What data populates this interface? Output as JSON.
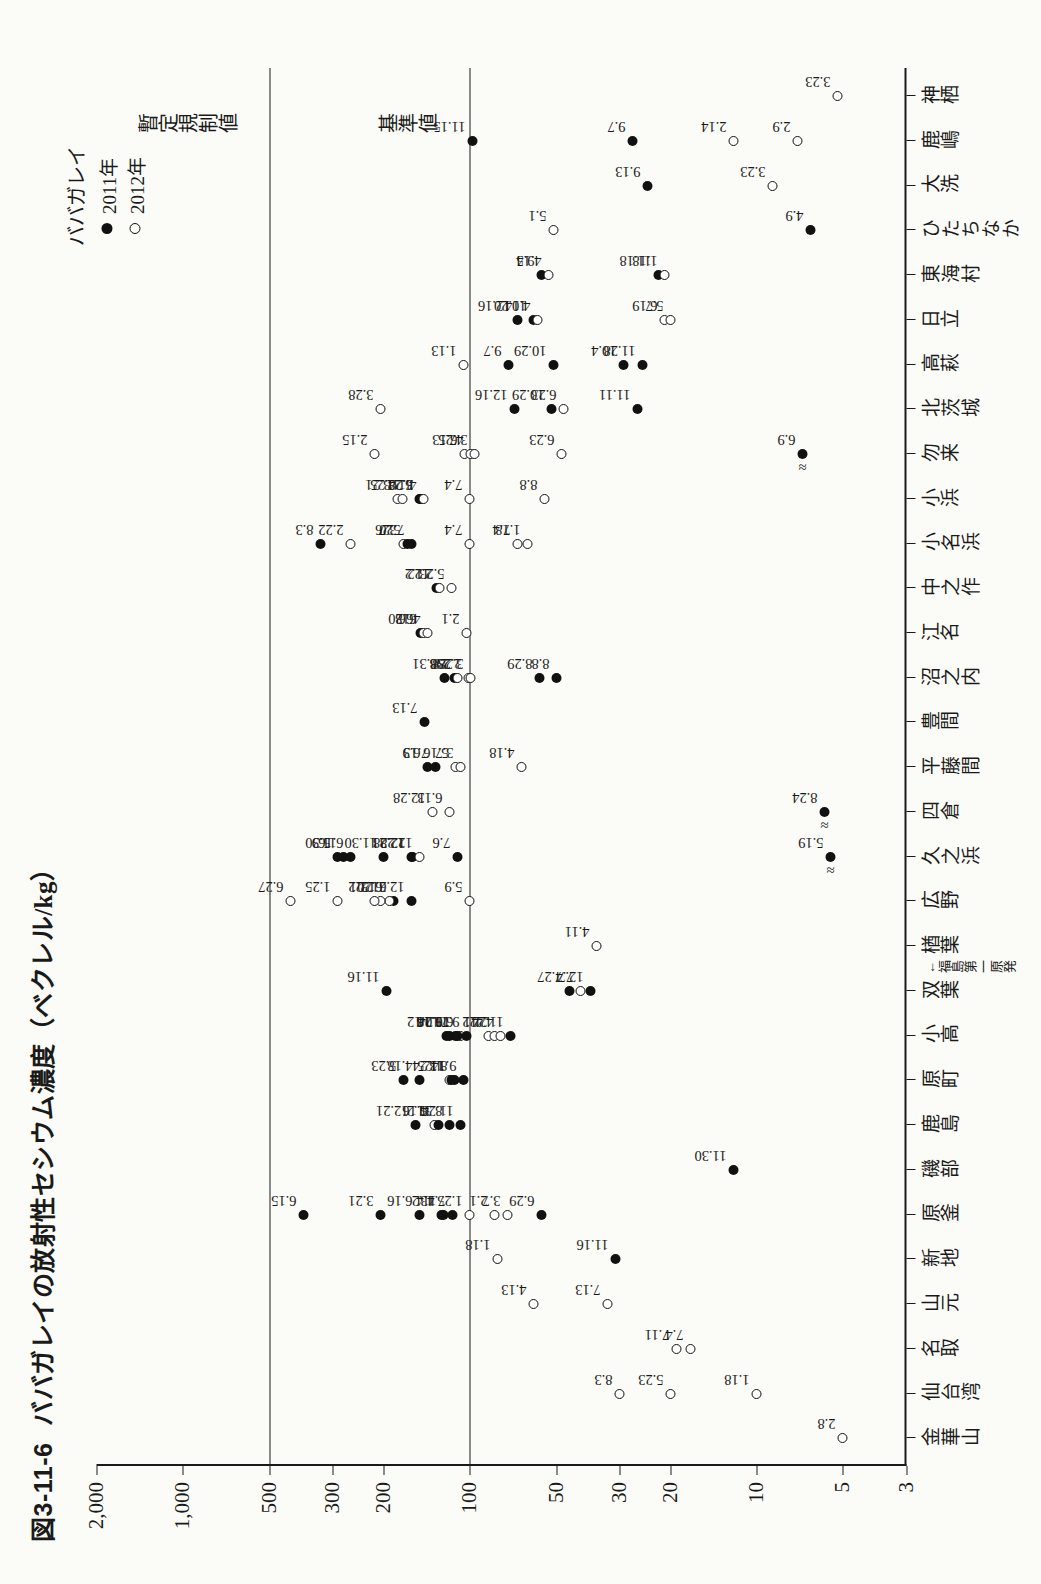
{
  "figure": {
    "number": "図3-11-6",
    "title": "ババガレイの放射性セシウム濃度（ベクレル/kg）"
  },
  "legend": {
    "title": "ババガレイ",
    "items": [
      {
        "label": "2011年",
        "marker": "filled-circle"
      },
      {
        "label": "2012年",
        "marker": "open-circle"
      }
    ]
  },
  "axes": {
    "y_title": "放射性セシウム濃度（ベクレル／kg）",
    "y_ticks": [
      "2,000",
      "1,000",
      "500",
      "300",
      "200",
      "100",
      "50",
      "30",
      "20",
      "10",
      "5",
      "3"
    ],
    "y_scale": "log",
    "y_min": 3,
    "y_max": 2000
  },
  "reference_lines": [
    {
      "label": "暫定規制値",
      "value": 500
    },
    {
      "label": "基準値",
      "value": 100
    }
  ],
  "locations": [
    "金華山",
    "仙台湾",
    "名取",
    "山元",
    "新地",
    "原釜",
    "磯部",
    "鹿島",
    "原町",
    "小高",
    "双葉",
    "楢葉",
    "広野",
    "久之浜",
    "四倉",
    "平藤間",
    "豊間",
    "沼之内",
    "江名",
    "中之作",
    "小名浜",
    "小浜",
    "勿来",
    "北茨城",
    "高萩",
    "日立",
    "東海村",
    "ひたちなか",
    "大洗",
    "鹿嶋",
    "神栖"
  ],
  "npp_marker": {
    "label": "福島第一原発",
    "location": "双葉"
  },
  "chart_data": {
    "type": "scatter",
    "title": "ババガレイの放射性セシウム濃度（ベクレル/kg）",
    "xlabel": "",
    "ylabel": "放射性セシウム濃度（ベクレル／kg）",
    "yscale": "log",
    "ylim": [
      3,
      2000
    ],
    "grid": false,
    "legend_position": "top-right",
    "series": [
      {
        "name": "2011年",
        "marker": "filled-circle"
      },
      {
        "name": "2012年",
        "marker": "open-circle"
      }
    ],
    "points": [
      {
        "loc": "金華山",
        "year": 2012,
        "value": 5,
        "label": "2.8"
      },
      {
        "loc": "仙台湾",
        "year": 2012,
        "value": 20,
        "label": "5.23"
      },
      {
        "loc": "仙台湾",
        "year": 2012,
        "value": 10,
        "label": "1.18"
      },
      {
        "loc": "仙台湾",
        "year": 2012,
        "value": 30,
        "label": "8.3"
      },
      {
        "loc": "名取",
        "year": 2012,
        "value": 17,
        "label": "7.4"
      },
      {
        "loc": "名取",
        "year": 2012,
        "value": 19,
        "label": "7.11"
      },
      {
        "loc": "山元",
        "year": 2012,
        "value": 33,
        "label": "7.13"
      },
      {
        "loc": "山元",
        "year": 2012,
        "value": 60,
        "label": "4.13"
      },
      {
        "loc": "新地",
        "year": 2012,
        "value": 80,
        "label": "1.18"
      },
      {
        "loc": "新地",
        "year": 2011,
        "value": 31,
        "label": "11.16"
      },
      {
        "loc": "原釜",
        "year": 2011,
        "value": 380,
        "label": "6.15"
      },
      {
        "loc": "原釜",
        "year": 2011,
        "value": 205,
        "label": "3.21"
      },
      {
        "loc": "原釜",
        "year": 2011,
        "value": 150,
        "label": "6.16"
      },
      {
        "loc": "原釜",
        "year": 2011,
        "value": 125,
        "label": "4.4"
      },
      {
        "loc": "原釜",
        "year": 2011,
        "value": 123,
        "label": "11.2"
      },
      {
        "loc": "原釜",
        "year": 2011,
        "value": 115,
        "label": "7.13"
      },
      {
        "loc": "原釜",
        "year": 2012,
        "value": 100,
        "label": "1.25"
      },
      {
        "loc": "原釜",
        "year": 2012,
        "value": 82,
        "label": "2.1"
      },
      {
        "loc": "原釜",
        "year": 2012,
        "value": 74,
        "label": "3.7"
      },
      {
        "loc": "原釜",
        "year": 2011,
        "value": 56,
        "label": "6.29"
      },
      {
        "loc": "磯部",
        "year": 2011,
        "value": 12,
        "label": "11.30"
      },
      {
        "loc": "鹿島",
        "year": 2011,
        "value": 155,
        "label": "12.21"
      },
      {
        "loc": "鹿島",
        "year": 2012,
        "value": 133,
        "label": "5.16"
      },
      {
        "loc": "鹿島",
        "year": 2011,
        "value": 128,
        "label": "11.2"
      },
      {
        "loc": "鹿島",
        "year": 2011,
        "value": 118,
        "label": "8.31"
      },
      {
        "loc": "鹿島",
        "year": 2011,
        "value": 108,
        "label": "11.24"
      },
      {
        "loc": "原町",
        "year": 2011,
        "value": 170,
        "label": "5.23"
      },
      {
        "loc": "原町",
        "year": 2011,
        "value": 150,
        "label": "4.18"
      },
      {
        "loc": "原町",
        "year": 2012,
        "value": 118,
        "label": "1.25"
      },
      {
        "loc": "原町",
        "year": 2011,
        "value": 116,
        "label": "11.24"
      },
      {
        "loc": "原町",
        "year": 2011,
        "value": 113,
        "label": "8.3"
      },
      {
        "loc": "原町",
        "year": 2011,
        "value": 105,
        "label": "9.14"
      },
      {
        "loc": "小高",
        "year": 2011,
        "value": 118,
        "label": "9.28"
      },
      {
        "loc": "小高",
        "year": 2011,
        "value": 112,
        "label": "11.16"
      },
      {
        "loc": "小高",
        "year": 2012,
        "value": 108,
        "label": "6.6"
      },
      {
        "loc": "小高",
        "year": 2011,
        "value": 103,
        "label": "9.7"
      },
      {
        "loc": "小高",
        "year": 2011,
        "value": 120,
        "label": "10.12"
      },
      {
        "loc": "小高",
        "year": 2011,
        "value": 110,
        "label": "11.24"
      },
      {
        "loc": "小高",
        "year": 2012,
        "value": 86,
        "label": "2.1"
      },
      {
        "loc": "小高",
        "year": 2012,
        "value": 82,
        "label": "2.22"
      },
      {
        "loc": "小高",
        "year": 2012,
        "value": 78,
        "label": "4.4"
      },
      {
        "loc": "小高",
        "year": 2011,
        "value": 72,
        "label": "11.24"
      },
      {
        "loc": "双葉",
        "year": 2011,
        "value": 195,
        "label": "11.16"
      },
      {
        "loc": "双葉",
        "year": 2011,
        "value": 45,
        "label": "7.27"
      },
      {
        "loc": "双葉",
        "year": 2011,
        "value": 38,
        "label": "12.7"
      },
      {
        "loc": "双葉",
        "year": 2012,
        "value": 41,
        "label": "7.4"
      },
      {
        "loc": "楢葉",
        "year": 2012,
        "value": 36,
        "label": "4.11"
      },
      {
        "loc": "広野",
        "year": 2012,
        "value": 420,
        "label": "6.27"
      },
      {
        "loc": "広野",
        "year": 2011,
        "value": 185,
        "label": "6.13"
      },
      {
        "loc": "広野",
        "year": 2012,
        "value": 190,
        "label": "6.20"
      },
      {
        "loc": "広野",
        "year": 2011,
        "value": 160,
        "label": "12.21"
      },
      {
        "loc": "広野",
        "year": 2012,
        "value": 205,
        "label": "2.22"
      },
      {
        "loc": "広野",
        "year": 2012,
        "value": 215,
        "label": "2.1"
      },
      {
        "loc": "広野",
        "year": 2012,
        "value": 100,
        "label": "5.9"
      },
      {
        "loc": "広野",
        "year": 2012,
        "value": 290,
        "label": "1.25"
      },
      {
        "loc": "久之浜",
        "year": 2011,
        "value": 290,
        "label": "5.30"
      },
      {
        "loc": "久之浜",
        "year": 2011,
        "value": 275,
        "label": "11.9"
      },
      {
        "loc": "久之浜",
        "year": 2011,
        "value": 260,
        "label": "6.16"
      },
      {
        "loc": "久之浜",
        "year": 2011,
        "value": 200,
        "label": "11.30"
      },
      {
        "loc": "久之浜",
        "year": 2011,
        "value": 160,
        "label": "12.21"
      },
      {
        "loc": "久之浜",
        "year": 2011,
        "value": 158,
        "label": "12.28"
      },
      {
        "loc": "久之浜",
        "year": 2012,
        "value": 150,
        "label": "12.28"
      },
      {
        "loc": "久之浜",
        "year": 2011,
        "value": 110,
        "label": "7.6"
      },
      {
        "loc": "久之浜",
        "year": 2011,
        "value": 5.5,
        "label": "5.19",
        "break": true
      },
      {
        "loc": "四倉",
        "year": 2011,
        "value": 5.8,
        "label": "8.24",
        "break": true
      },
      {
        "loc": "四倉",
        "year": 2012,
        "value": 135,
        "label": "12.28"
      },
      {
        "loc": "四倉",
        "year": 2012,
        "value": 118,
        "label": "6.13"
      },
      {
        "loc": "平藤間",
        "year": 2011,
        "value": 140,
        "label": "6.9"
      },
      {
        "loc": "平藤間",
        "year": 2011,
        "value": 132,
        "label": "7.13"
      },
      {
        "loc": "平藤間",
        "year": 2012,
        "value": 112,
        "label": "5.16"
      },
      {
        "loc": "平藤間",
        "year": 2012,
        "value": 108,
        "label": "3.7"
      },
      {
        "loc": "平藤間",
        "year": 2012,
        "value": 66,
        "label": "4.18"
      },
      {
        "loc": "豊間",
        "year": 2011,
        "value": 144,
        "label": "7.13"
      },
      {
        "loc": "沼之内",
        "year": 2011,
        "value": 122,
        "label": "8.31"
      },
      {
        "loc": "沼之内",
        "year": 2011,
        "value": 113,
        "label": "2.8"
      },
      {
        "loc": "沼之内",
        "year": 2012,
        "value": 110,
        "label": "2.8"
      },
      {
        "loc": "沼之内",
        "year": 2012,
        "value": 101,
        "label": "2.29"
      },
      {
        "loc": "沼之内",
        "year": 2012,
        "value": 99,
        "label": "3.28"
      },
      {
        "loc": "沼之内",
        "year": 2011,
        "value": 57,
        "label": "8.29"
      },
      {
        "loc": "沼之内",
        "year": 2011,
        "value": 50,
        "label": "8.8"
      },
      {
        "loc": "江名",
        "year": 2011,
        "value": 148,
        "label": "6.20"
      },
      {
        "loc": "江名",
        "year": 2012,
        "value": 145,
        "label": "6.6"
      },
      {
        "loc": "江名",
        "year": 2012,
        "value": 140,
        "label": "4.18"
      },
      {
        "loc": "江名",
        "year": 2012,
        "value": 103,
        "label": "2.1"
      },
      {
        "loc": "中之作",
        "year": 2011,
        "value": 130,
        "label": "11.2"
      },
      {
        "loc": "中之作",
        "year": 2012,
        "value": 127,
        "label": "2.22"
      },
      {
        "loc": "中之作",
        "year": 2012,
        "value": 116,
        "label": "5.23"
      },
      {
        "loc": "小名浜",
        "year": 2011,
        "value": 330,
        "label": "8.3"
      },
      {
        "loc": "小名浜",
        "year": 2012,
        "value": 260,
        "label": "2.22"
      },
      {
        "loc": "小名浜",
        "year": 2012,
        "value": 170,
        "label": "3.7"
      },
      {
        "loc": "小名浜",
        "year": 2011,
        "value": 165,
        "label": "5.26"
      },
      {
        "loc": "小名浜",
        "year": 2011,
        "value": 160,
        "label": "7.20"
      },
      {
        "loc": "小名浜",
        "year": 2012,
        "value": 100,
        "label": "7.4"
      },
      {
        "loc": "小名浜",
        "year": 2012,
        "value": 68,
        "label": "7.4"
      },
      {
        "loc": "小名浜",
        "year": 2012,
        "value": 63,
        "label": "1.18"
      },
      {
        "loc": "小浜",
        "year": 2012,
        "value": 178,
        "label": "3.21"
      },
      {
        "loc": "小浜",
        "year": 2012,
        "value": 172,
        "label": "4.25"
      },
      {
        "loc": "小浜",
        "year": 2011,
        "value": 150,
        "label": "6.22"
      },
      {
        "loc": "小浜",
        "year": 2011,
        "value": 148,
        "label": "3.28"
      },
      {
        "loc": "小浜",
        "year": 2012,
        "value": 145,
        "label": "4.11"
      },
      {
        "loc": "小浜",
        "year": 2012,
        "value": 100,
        "label": "7.4"
      },
      {
        "loc": "小浜",
        "year": 2012,
        "value": 55,
        "label": "8.8"
      },
      {
        "loc": "勿来",
        "year": 2012,
        "value": 215,
        "label": "2.15"
      },
      {
        "loc": "勿来",
        "year": 2012,
        "value": 104,
        "label": "6.13"
      },
      {
        "loc": "勿来",
        "year": 2012,
        "value": 99,
        "label": "4.25"
      },
      {
        "loc": "勿来",
        "year": 2012,
        "value": 96,
        "label": "3.7"
      },
      {
        "loc": "勿来",
        "year": 2012,
        "value": 48,
        "label": "6.23"
      },
      {
        "loc": "勿来",
        "year": 2011,
        "value": 6.9,
        "label": "6.9",
        "break": true
      },
      {
        "loc": "北茨城",
        "year": 2012,
        "value": 205,
        "label": "3.28"
      },
      {
        "loc": "北茨城",
        "year": 2011,
        "value": 70,
        "label": "12.16"
      },
      {
        "loc": "北茨城",
        "year": 2011,
        "value": 52,
        "label": "10.29"
      },
      {
        "loc": "北茨城",
        "year": 2012,
        "value": 47,
        "label": "6.23"
      },
      {
        "loc": "北茨城",
        "year": 2011,
        "value": 26,
        "label": "11.11"
      },
      {
        "loc": "高萩",
        "year": 2012,
        "value": 105,
        "label": "1.13"
      },
      {
        "loc": "高萩",
        "year": 2011,
        "value": 73,
        "label": "9.7"
      },
      {
        "loc": "高萩",
        "year": 2011,
        "value": 51,
        "label": "10.29"
      },
      {
        "loc": "高萩",
        "year": 2011,
        "value": 29,
        "label": "10.4"
      },
      {
        "loc": "高萩",
        "year": 2011,
        "value": 25,
        "label": "11.28"
      },
      {
        "loc": "日立",
        "year": 2011,
        "value": 68,
        "label": "12.16"
      },
      {
        "loc": "日立",
        "year": 2011,
        "value": 60,
        "label": "10.20"
      },
      {
        "loc": "日立",
        "year": 2012,
        "value": 58,
        "label": "4.14"
      },
      {
        "loc": "日立",
        "year": 2012,
        "value": 21,
        "label": "6.19"
      },
      {
        "loc": "日立",
        "year": 2012,
        "value": 20,
        "label": "5.7"
      },
      {
        "loc": "東海村",
        "year": 2011,
        "value": 56,
        "label": "9.5"
      },
      {
        "loc": "東海村",
        "year": 2012,
        "value": 53,
        "label": "4.14"
      },
      {
        "loc": "東海村",
        "year": 2011,
        "value": 22,
        "label": "11.18"
      },
      {
        "loc": "東海村",
        "year": 2012,
        "value": 21,
        "label": "1.18"
      },
      {
        "loc": "ひたちなか",
        "year": 2012,
        "value": 51,
        "label": "5.1"
      },
      {
        "loc": "ひたちなか",
        "year": 2011,
        "value": 6.5,
        "label": "4.9"
      },
      {
        "loc": "大洗",
        "year": 2011,
        "value": 24,
        "label": "9.13"
      },
      {
        "loc": "大洗",
        "year": 2012,
        "value": 8.8,
        "label": "3.23"
      },
      {
        "loc": "鹿嶋",
        "year": 2011,
        "value": 98,
        "label": "11.15"
      },
      {
        "loc": "鹿嶋",
        "year": 2011,
        "value": 27,
        "label": "9.7"
      },
      {
        "loc": "鹿嶋",
        "year": 2012,
        "value": 12,
        "label": "2.14"
      },
      {
        "loc": "鹿嶋",
        "year": 2012,
        "value": 7.2,
        "label": "2.9"
      },
      {
        "loc": "神栖",
        "year": 2012,
        "value": 5.2,
        "label": "3.23"
      }
    ]
  }
}
